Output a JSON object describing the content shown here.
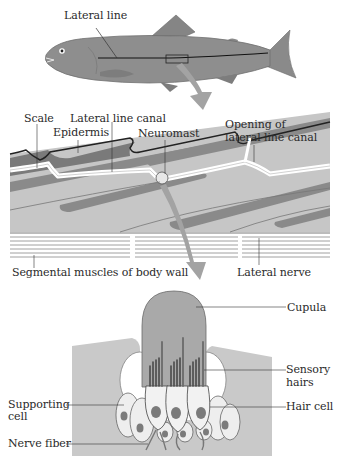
{
  "diagram": {
    "type": "biology-illustration",
    "panels": [
      {
        "id": "fish",
        "labels": [
          "Lateral line"
        ]
      },
      {
        "id": "lateral-line-section",
        "labels": [
          "Scale",
          "Lateral line canal",
          "Epidermis",
          "Neuromast",
          "Opening of lateral line canal",
          "Segmental muscles of body wall",
          "Lateral nerve"
        ]
      },
      {
        "id": "neuromast-detail",
        "labels": [
          "Cupula",
          "Sensory hairs",
          "Hair cell",
          "Supporting cell",
          "Nerve fiber"
        ]
      }
    ]
  },
  "labels": {
    "lateral_line": "Lateral line",
    "scale": "Scale",
    "lateral_line_canal": "Lateral line canal",
    "epidermis": "Epidermis",
    "neuromast": "Neuromast",
    "opening_line1": "Opening of",
    "opening_line2": "lateral line canal",
    "segmental_muscles": "Segmental muscles of body wall",
    "lateral_nerve": "Lateral nerve",
    "cupula": "Cupula",
    "sensory_line1": "Sensory",
    "sensory_line2": "hairs",
    "hair_cell": "Hair cell",
    "supporting_line1": "Supporting",
    "supporting_line2": "cell",
    "nerve_fiber": "Nerve fiber"
  },
  "colors": {
    "fish_body": "#8c8c8c",
    "tissue_light": "#c8c8c8",
    "tissue_mid": "#9a9a9a",
    "scale_dark": "#6e6e6e",
    "arrow": "#a0a0a0",
    "cupula": "#a8a8a8",
    "cell_fill": "#efefef",
    "nucleus": "#7a7a7a"
  }
}
